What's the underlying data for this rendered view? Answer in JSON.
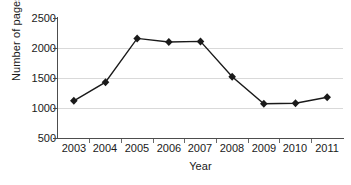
{
  "chart_data": {
    "type": "line",
    "title": "",
    "xlabel": "Year",
    "ylabel": "Number of pages",
    "categories": [
      "2003",
      "2004",
      "2005",
      "2006",
      "2007",
      "2008",
      "2009",
      "2010",
      "2011"
    ],
    "values": [
      1120,
      1430,
      2160,
      2100,
      2110,
      1520,
      1070,
      1080,
      1180
    ],
    "series": [
      {
        "name": "Number of pages",
        "values": [
          1120,
          1430,
          2160,
          2100,
          2110,
          1520,
          1070,
          1080,
          1180
        ]
      }
    ],
    "ylim": [
      500,
      2500
    ],
    "yticks": [
      "500",
      "1000",
      "1500",
      "2000",
      "2500"
    ],
    "ytick_values": [
      500,
      1000,
      1500,
      2000,
      2500
    ],
    "xticks": [
      "2003",
      "2004",
      "2005",
      "2006",
      "2007",
      "2008",
      "2009",
      "2010",
      "2011"
    ],
    "grid": "horizontal",
    "legend": "none",
    "marker": "diamond",
    "colors": {
      "line": "#1a1a1a",
      "marker": "#1a1a1a",
      "grid": "#d9d9d9",
      "axis": "#4d4d4d",
      "text": "#1a1a1a",
      "background": "#ffffff"
    }
  }
}
